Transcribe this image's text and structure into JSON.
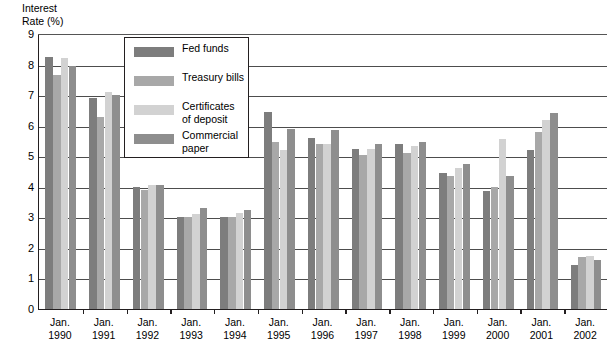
{
  "chart_data": {
    "type": "bar",
    "title": "",
    "ylabel": "Interest\nRate (%)",
    "xlabel": "",
    "ylim": [
      0,
      9
    ],
    "yticks": [
      "0",
      "1",
      "2",
      "3",
      "4",
      "5",
      "6",
      "7",
      "8",
      "9"
    ],
    "grid": true,
    "legend_position": "top-center-inside",
    "categories": [
      "Jan.\n1990",
      "Jan.\n1991",
      "Jan.\n1992",
      "Jan.\n1993",
      "Jan.\n1994",
      "Jan.\n1995",
      "Jan.\n1996",
      "Jan.\n1997",
      "Jan.\n1998",
      "Jan.\n1999",
      "Jan.\n2000",
      "Jan.\n2001",
      "Jan.\n2002"
    ],
    "series": [
      {
        "name": "Fed funds",
        "color": "#7d7d7d",
        "values": [
          8.25,
          6.9,
          4.0,
          3.0,
          3.0,
          6.45,
          5.6,
          5.25,
          5.4,
          4.45,
          3.85,
          5.2,
          1.45
        ]
      },
      {
        "name": "Treasury bills",
        "color": "#a8a8a8",
        "values": [
          7.65,
          6.3,
          3.9,
          3.0,
          3.0,
          5.45,
          5.4,
          5.05,
          5.1,
          4.35,
          4.0,
          5.8,
          1.7
        ]
      },
      {
        "name": "Certificates\nof deposit",
        "color": "#d2d2d2",
        "values": [
          8.2,
          7.1,
          4.05,
          3.1,
          3.15,
          5.2,
          5.4,
          5.25,
          5.35,
          4.6,
          5.55,
          6.2,
          1.72
        ]
      },
      {
        "name": "Commercial\npaper",
        "color": "#8e8e8e",
        "values": [
          7.95,
          7.0,
          4.05,
          3.3,
          3.25,
          5.9,
          5.85,
          5.4,
          5.45,
          4.75,
          4.35,
          6.4,
          1.6
        ]
      }
    ]
  },
  "colors": {
    "axis": "#231f20",
    "gridline": "#4d4d4d",
    "background": "#ffffff"
  }
}
